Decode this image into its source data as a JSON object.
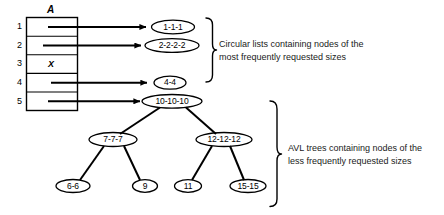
{
  "diagram": {
    "array": {
      "name_label": "A",
      "rows": [
        {
          "index": "1",
          "value": ""
        },
        {
          "index": "2",
          "value": ""
        },
        {
          "index": "3",
          "value": "X"
        },
        {
          "index": "4",
          "value": ""
        },
        {
          "index": "5",
          "value": ""
        }
      ]
    },
    "circular_lists": [
      {
        "from_row": "1",
        "label": "1-1-1"
      },
      {
        "from_row": "2",
        "label": "2-2-2-2"
      },
      {
        "from_row": "4",
        "label": "4-4"
      }
    ],
    "tree": {
      "root": {
        "label": "10-10-10",
        "from_row": "5"
      },
      "level2": [
        {
          "label": "7-7-7"
        },
        {
          "label": "12-12-12"
        }
      ],
      "level3": [
        {
          "label": "6-6",
          "parent": "7-7-7"
        },
        {
          "label": "9",
          "parent": "7-7-7"
        },
        {
          "label": "11",
          "parent": "12-12-12"
        },
        {
          "label": "15-15",
          "parent": "12-12-12"
        }
      ]
    },
    "annotations": [
      {
        "id": "circular-lists-note",
        "line1": "Circular lists containing nodes of the",
        "line2": "most frequently requested sizes"
      },
      {
        "id": "avl-trees-note",
        "line1": "AVL trees containing nodes of the",
        "line2": "less frequently requested sizes"
      }
    ],
    "colors": {
      "stroke": "#000000",
      "background": "#ffffff",
      "text": "#1a1a1a"
    }
  }
}
